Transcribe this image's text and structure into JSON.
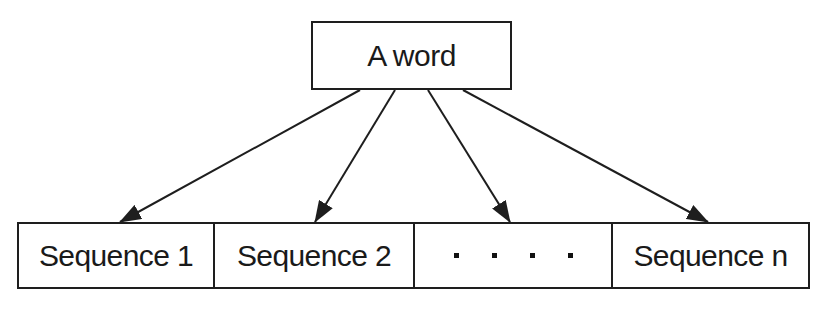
{
  "diagram": {
    "type": "one-to-many mapping",
    "source_node": {
      "label": "A word"
    },
    "target_nodes": [
      {
        "label": "Sequence 1"
      },
      {
        "label": "Sequence 2"
      },
      {
        "label": ". . . .",
        "is_ellipsis": true,
        "dot_count": 4
      },
      {
        "label": "Sequence n"
      }
    ],
    "edges": [
      {
        "from": "A word",
        "to": "Sequence 1"
      },
      {
        "from": "A word",
        "to": "Sequence 2"
      },
      {
        "from": "A word",
        "to": ". . . ."
      },
      {
        "from": "A word",
        "to": "Sequence n"
      }
    ],
    "colors": {
      "stroke": "#1e1e1e",
      "background": "#ffffff",
      "text": "#1a1a1a"
    }
  }
}
